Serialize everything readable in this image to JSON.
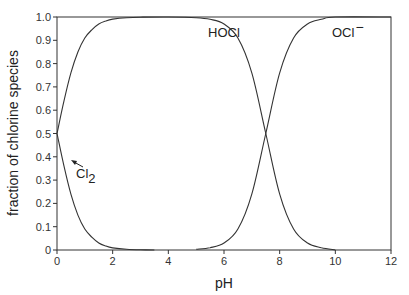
{
  "chart_data": {
    "type": "line",
    "title": "",
    "xlabel": "pH",
    "ylabel": "fraction of chlorine species",
    "xlim": [
      0,
      12
    ],
    "ylim": [
      0,
      1.0
    ],
    "xticks": [
      0,
      2,
      4,
      6,
      8,
      10,
      12
    ],
    "yticks": [
      0,
      0.1,
      0.2,
      0.3,
      0.4,
      0.5,
      0.6,
      0.7,
      0.8,
      0.9,
      1.0
    ],
    "ytick_labels": [
      "0",
      "0.1",
      "0.2",
      "0.3",
      "0.4",
      "0.5",
      "0.6",
      "0.7",
      "0.8",
      "0.9",
      "1.0"
    ],
    "grid": false,
    "legend": "inline labels",
    "series": [
      {
        "name": "Cl2",
        "label": "Cl",
        "subscript": "2",
        "x": [
          0,
          0.25,
          0.5,
          0.75,
          1.0,
          1.25,
          1.5,
          1.75,
          2.0,
          2.5,
          3.0,
          3.5
        ],
        "values": [
          0.5,
          0.36,
          0.24,
          0.15,
          0.09,
          0.055,
          0.03,
          0.017,
          0.009,
          0.003,
          0.001,
          0
        ]
      },
      {
        "name": "HOCl",
        "label": "HOCl",
        "x": [
          0,
          0.25,
          0.5,
          0.75,
          1.0,
          1.25,
          1.5,
          1.75,
          2.0,
          2.5,
          3.0,
          4.0,
          5.0,
          5.5,
          6.0,
          6.5,
          7.0,
          7.5,
          8.0,
          8.5,
          9.0,
          9.5,
          10.0
        ],
        "values": [
          0.5,
          0.64,
          0.76,
          0.85,
          0.91,
          0.945,
          0.97,
          0.983,
          0.991,
          0.997,
          0.999,
          1.0,
          0.997,
          0.99,
          0.97,
          0.91,
          0.76,
          0.5,
          0.24,
          0.09,
          0.03,
          0.01,
          0.0
        ]
      },
      {
        "name": "OCl-",
        "label": "OCl",
        "superscript": "−",
        "x": [
          5.0,
          5.5,
          6.0,
          6.5,
          7.0,
          7.5,
          8.0,
          8.5,
          9.0,
          9.5,
          10.0,
          12.0
        ],
        "values": [
          0.003,
          0.01,
          0.03,
          0.09,
          0.24,
          0.5,
          0.76,
          0.91,
          0.97,
          0.99,
          1.0,
          1.0
        ]
      }
    ],
    "annotations": [
      {
        "text": "HOCl",
        "x": 4.6,
        "y": 0.93
      },
      {
        "text": "OCl−",
        "x": 10.4,
        "y": 0.93
      },
      {
        "text": "Cl2",
        "x": 0.6,
        "y": 0.37,
        "arrow_to": [
          0.3,
          0.42
        ]
      }
    ]
  },
  "labels": {
    "xlabel": "pH",
    "ylabel": "fraction of chlorine species",
    "hocl": "HOCl",
    "ocl": "OCl",
    "ocl_sup": "−",
    "cl": "Cl",
    "cl_sub": "2"
  }
}
